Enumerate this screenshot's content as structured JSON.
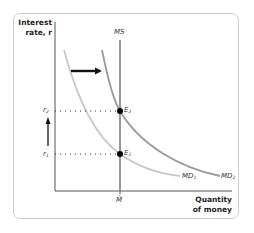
{
  "diagram": {
    "type": "money-market-diagram",
    "y_axis_label": [
      "Interest",
      "rate, r"
    ],
    "x_axis_label": [
      "Quantity",
      "of money"
    ],
    "curves": [
      {
        "id": "MS",
        "label": "MS",
        "kind": "vertical supply",
        "color": "#8c8c8c"
      },
      {
        "id": "MD1",
        "label": "MD",
        "sub": "1",
        "kind": "demand (initial)",
        "color": "#c7c7c7"
      },
      {
        "id": "MD2",
        "label": "MD",
        "sub": "2",
        "kind": "demand (shifted right)",
        "color": "#9a9a9a"
      }
    ],
    "points": [
      {
        "label": "E",
        "sub": "2",
        "on": "MS ∩ MD2"
      },
      {
        "label": "E",
        "sub": "1",
        "on": "MS ∩ MD1"
      }
    ],
    "y_ticks": [
      {
        "label": "r",
        "sub": "2"
      },
      {
        "label": "r",
        "sub": "1"
      }
    ],
    "x_ticks": [
      {
        "label": "M̄"
      }
    ],
    "annotations": [
      {
        "kind": "arrow-right",
        "meaning": "money demand shifts right"
      },
      {
        "kind": "arrow-up",
        "meaning": "interest rate rises from r1 to r2"
      }
    ]
  }
}
